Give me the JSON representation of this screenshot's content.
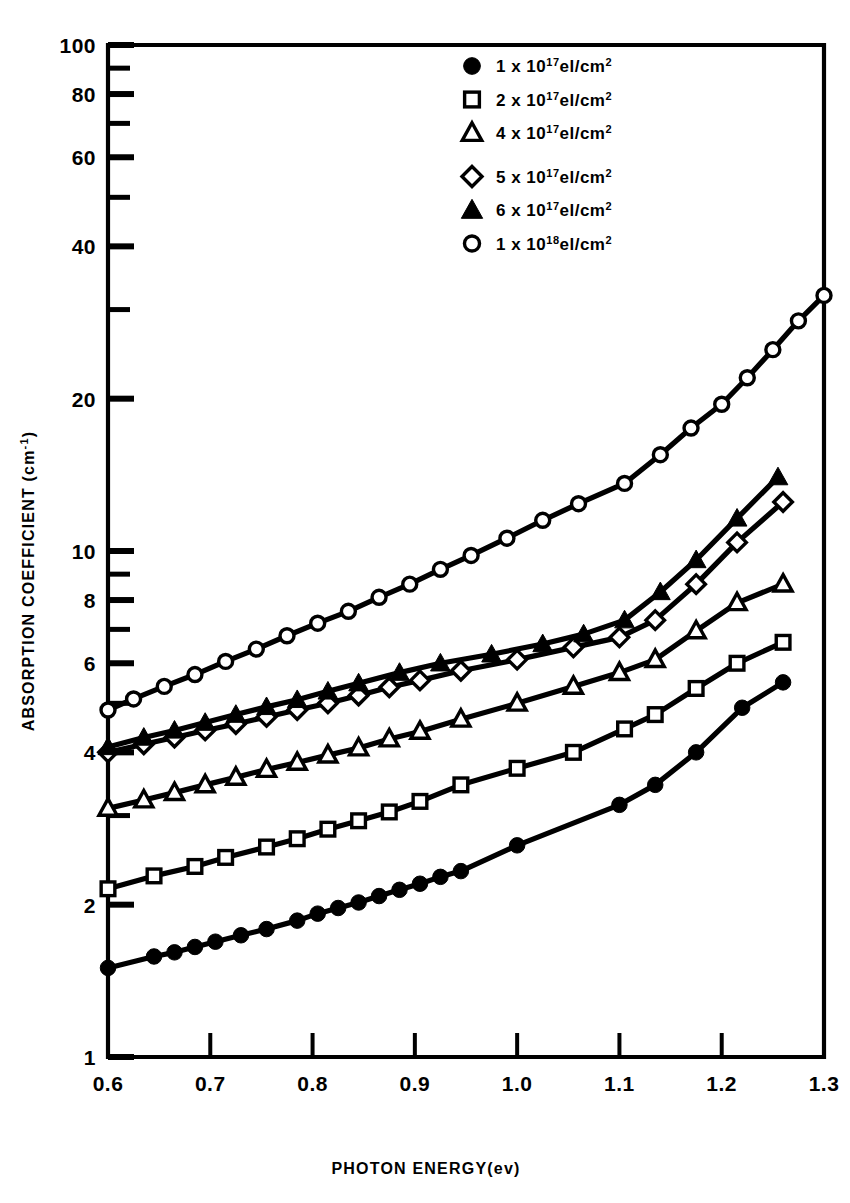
{
  "chart_data": {
    "type": "line",
    "title": "",
    "xlabel": "PHOTON ENERGY(ev)",
    "ylabel": "ABSORPTION COEFFICIENT (cm",
    "ylabel_exp": "-1",
    "ylabel_tail": ")",
    "xscale": "linear",
    "yscale": "log",
    "xlim": [
      0.6,
      1.3
    ],
    "ylim": [
      1,
      100
    ],
    "grid": false,
    "legend_position": "top-right",
    "xticks": [
      "0.6",
      "0.7",
      "0.8",
      "0.9",
      "1.0",
      "1.1",
      "1.2",
      "1.3"
    ],
    "xtick_values": [
      0.6,
      0.7,
      0.8,
      0.9,
      1.0,
      1.1,
      1.2,
      1.3
    ],
    "yticks": [
      "1",
      "2",
      "4",
      "6",
      "8",
      "10",
      "20",
      "40",
      "60",
      "80",
      "100"
    ],
    "ytick_values": [
      1,
      2,
      4,
      6,
      8,
      10,
      20,
      40,
      60,
      80,
      100
    ],
    "yminor_values": [
      3,
      5,
      7,
      9,
      30,
      50,
      70,
      90
    ],
    "series": [
      {
        "name": "1 x 10^17 el/cm2",
        "legend_num": "1",
        "legend_x": "x",
        "legend_base": "10",
        "legend_exp": "17",
        "legend_unit": "el/cm",
        "legend_unit_exp": "2",
        "marker": "filled-circle",
        "x": [
          0.6,
          0.645,
          0.665,
          0.685,
          0.705,
          0.73,
          0.755,
          0.785,
          0.805,
          0.825,
          0.845,
          0.865,
          0.885,
          0.905,
          0.925,
          0.945,
          1.0,
          1.1,
          1.135,
          1.175,
          1.22,
          1.26
        ],
        "y": [
          1.5,
          1.58,
          1.61,
          1.65,
          1.69,
          1.74,
          1.79,
          1.86,
          1.92,
          1.97,
          2.02,
          2.08,
          2.14,
          2.2,
          2.27,
          2.33,
          2.62,
          3.15,
          3.45,
          4.0,
          4.9,
          5.5
        ]
      },
      {
        "name": "2 x 10^17 el/cm2",
        "legend_num": "2",
        "legend_x": "x",
        "legend_base": "10",
        "legend_exp": "17",
        "legend_unit": "el/cm",
        "legend_unit_exp": "2",
        "marker": "open-square",
        "x": [
          0.6,
          0.645,
          0.685,
          0.715,
          0.755,
          0.785,
          0.815,
          0.845,
          0.875,
          0.905,
          0.945,
          1.0,
          1.055,
          1.105,
          1.135,
          1.175,
          1.215,
          1.26
        ],
        "y": [
          2.15,
          2.28,
          2.38,
          2.48,
          2.6,
          2.7,
          2.82,
          2.93,
          3.05,
          3.2,
          3.45,
          3.72,
          4.0,
          4.45,
          4.75,
          5.35,
          6.0,
          6.6
        ]
      },
      {
        "name": "4 x 10^17 el/cm2",
        "legend_num": "4",
        "legend_x": "x",
        "legend_base": "10",
        "legend_exp": "17",
        "legend_unit": "el/cm",
        "legend_unit_exp": "2",
        "marker": "open-triangle",
        "x": [
          0.6,
          0.635,
          0.665,
          0.695,
          0.725,
          0.755,
          0.785,
          0.815,
          0.845,
          0.875,
          0.905,
          0.945,
          1.0,
          1.055,
          1.1,
          1.135,
          1.175,
          1.215,
          1.26
        ],
        "y": [
          3.1,
          3.22,
          3.33,
          3.45,
          3.57,
          3.7,
          3.82,
          3.95,
          4.08,
          4.25,
          4.4,
          4.65,
          5.0,
          5.4,
          5.75,
          6.1,
          6.95,
          7.9,
          8.6
        ]
      },
      {
        "name": "5 x 10^17 el/cm2",
        "legend_num": "5",
        "legend_x": "x",
        "legend_base": "10",
        "legend_exp": "17",
        "legend_unit": "el/cm",
        "legend_unit_exp": "2",
        "marker": "open-diamond",
        "x": [
          0.6,
          0.635,
          0.665,
          0.695,
          0.725,
          0.755,
          0.785,
          0.815,
          0.845,
          0.875,
          0.905,
          0.945,
          1.0,
          1.055,
          1.1,
          1.135,
          1.175,
          1.215,
          1.26
        ],
        "y": [
          4.0,
          4.15,
          4.28,
          4.42,
          4.55,
          4.7,
          4.85,
          5.0,
          5.18,
          5.38,
          5.55,
          5.8,
          6.1,
          6.45,
          6.75,
          7.3,
          8.6,
          10.4,
          12.5
        ]
      },
      {
        "name": "6 x 10^17 el/cm2",
        "legend_num": "6",
        "legend_x": "x",
        "legend_base": "10",
        "legend_exp": "17",
        "legend_unit": "el/cm",
        "legend_unit_exp": "2",
        "marker": "filled-triangle",
        "x": [
          0.6,
          0.635,
          0.665,
          0.695,
          0.725,
          0.755,
          0.785,
          0.815,
          0.845,
          0.885,
          0.925,
          0.975,
          1.025,
          1.065,
          1.105,
          1.14,
          1.175,
          1.215,
          1.255
        ],
        "y": [
          4.1,
          4.28,
          4.42,
          4.58,
          4.75,
          4.92,
          5.08,
          5.28,
          5.48,
          5.75,
          6.0,
          6.25,
          6.55,
          6.85,
          7.3,
          8.3,
          9.6,
          11.6,
          14.0
        ]
      },
      {
        "name": "1 x 10^18 el/cm2",
        "legend_num": "1",
        "legend_x": "x",
        "legend_base": "10",
        "legend_exp": "18",
        "legend_unit": "el/cm",
        "legend_unit_exp": "2",
        "marker": "open-circle",
        "x": [
          0.6,
          0.625,
          0.655,
          0.685,
          0.715,
          0.745,
          0.775,
          0.805,
          0.835,
          0.865,
          0.895,
          0.925,
          0.955,
          0.99,
          1.025,
          1.06,
          1.105,
          1.14,
          1.17,
          1.2,
          1.225,
          1.25,
          1.275,
          1.3
        ],
        "y": [
          4.85,
          5.1,
          5.4,
          5.7,
          6.05,
          6.4,
          6.8,
          7.2,
          7.6,
          8.1,
          8.6,
          9.2,
          9.8,
          10.6,
          11.5,
          12.4,
          13.6,
          15.5,
          17.5,
          19.5,
          22.0,
          25.0,
          28.5,
          32.0
        ]
      }
    ]
  },
  "geometry": {
    "plot_left": 108,
    "plot_right": 824,
    "plot_top": 45,
    "plot_bottom": 1057
  }
}
